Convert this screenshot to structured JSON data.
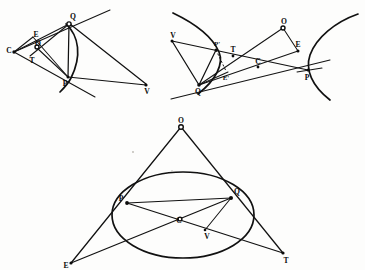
{
  "plate": {
    "name": "conic-sections-plate",
    "background_color": "#fdfdfc",
    "ink_color": "#111111",
    "figure_count": 3,
    "figures": [
      {
        "id": "figure-parabola",
        "conic_type": "parabola",
        "position": "top-left",
        "labels": [
          {
            "id": "lbl-C",
            "text": "C",
            "x": 9,
            "y": 51
          },
          {
            "id": "lbl-E",
            "text": "E",
            "x": 36,
            "y": 35
          },
          {
            "id": "lbl-O",
            "text": "O",
            "x": 38,
            "y": 44
          },
          {
            "id": "lbl-T",
            "text": "T",
            "x": 32,
            "y": 61
          },
          {
            "id": "lbl-Q",
            "text": "Q",
            "x": 73,
            "y": 17
          },
          {
            "id": "lbl-P",
            "text": "P",
            "x": 65,
            "y": 79
          },
          {
            "id": "lbl-V",
            "text": "V",
            "x": 147,
            "y": 88
          }
        ]
      },
      {
        "id": "figure-hyperbola",
        "conic_type": "hyperbola",
        "position": "top-right",
        "labels": [
          {
            "id": "lbl-V2",
            "text": "V",
            "x": 173,
            "y": 40
          },
          {
            "id": "lbl-Pp",
            "text": "P'",
            "x": 216,
            "y": 45
          },
          {
            "id": "lbl-T2",
            "text": "T",
            "x": 233,
            "y": 51
          },
          {
            "id": "lbl-O2",
            "text": "O",
            "x": 284,
            "y": 23
          },
          {
            "id": "lbl-E2",
            "text": "E",
            "x": 297,
            "y": 45
          },
          {
            "id": "lbl-C2",
            "text": "C",
            "x": 257,
            "y": 62
          },
          {
            "id": "lbl-Ep",
            "text": "E'",
            "x": 224,
            "y": 76
          },
          {
            "id": "lbl-Q2",
            "text": "Q",
            "x": 199,
            "y": 89
          },
          {
            "id": "lbl-P2",
            "text": "P",
            "x": 305,
            "y": 78
          }
        ]
      },
      {
        "id": "figure-ellipse",
        "conic_type": "ellipse",
        "position": "bottom-center",
        "labels": [
          {
            "id": "lbl-O3",
            "text": "O",
            "x": 181,
            "y": 122
          },
          {
            "id": "lbl-P3",
            "text": "P",
            "x": 123,
            "y": 200
          },
          {
            "id": "lbl-Q3",
            "text": "Q",
            "x": 234,
            "y": 193
          },
          {
            "id": "lbl-C3",
            "text": "C",
            "x": 178,
            "y": 222
          },
          {
            "id": "lbl-V3",
            "text": "V",
            "x": 207,
            "y": 233
          },
          {
            "id": "lbl-E3",
            "text": "E",
            "x": 66,
            "y": 262
          },
          {
            "id": "lbl-T3",
            "text": "T",
            "x": 284,
            "y": 258
          }
        ]
      }
    ]
  }
}
